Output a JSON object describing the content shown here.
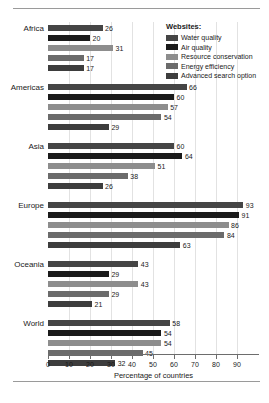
{
  "chart_data": {
    "type": "bar",
    "orientation": "horizontal",
    "title": "",
    "xlabel": "Percentage of countries",
    "ylabel": "",
    "xlim": [
      0,
      100
    ],
    "xticks": [
      0,
      10,
      20,
      30,
      40,
      50,
      60,
      70,
      80,
      90
    ],
    "grid": true,
    "legend_position": "top-right",
    "legend_title": "Websites:",
    "categories": [
      "Africa",
      "Americas",
      "Asia",
      "Europe",
      "Oceania",
      "World"
    ],
    "series": [
      {
        "name": "Water quality",
        "color": "#454545",
        "values": [
          26,
          66,
          60,
          93,
          43,
          58
        ]
      },
      {
        "name": "Air quality",
        "color": "#1a1a1a",
        "values": [
          20,
          60,
          64,
          91,
          29,
          54
        ]
      },
      {
        "name": "Resource conservation",
        "color": "#8d8d8d",
        "values": [
          31,
          57,
          51,
          86,
          43,
          54
        ]
      },
      {
        "name": "Energy efficiency",
        "color": "#6b6b6b",
        "values": [
          17,
          54,
          38,
          84,
          29,
          45
        ]
      },
      {
        "name": "Advanced search option",
        "color": "#3d3d3d",
        "values": [
          17,
          29,
          26,
          63,
          21,
          32
        ]
      }
    ]
  }
}
